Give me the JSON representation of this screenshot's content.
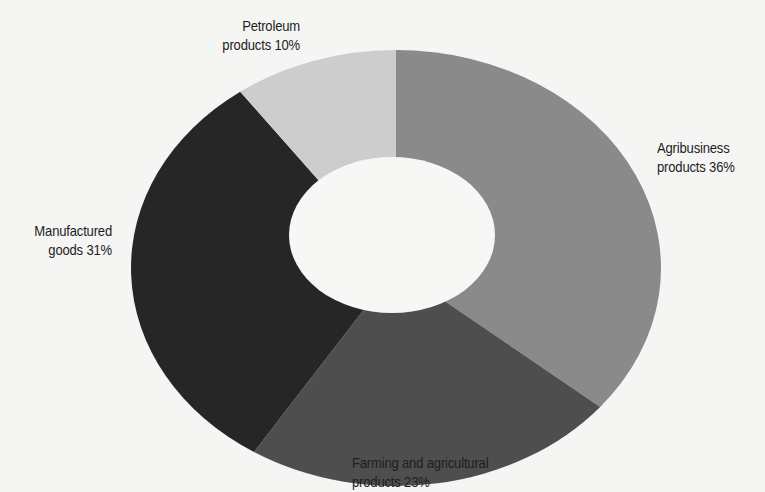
{
  "chart_data": {
    "type": "pie",
    "variant": "donut",
    "title": "",
    "start_angle_deg": 0,
    "direction": "clockwise",
    "categories": [
      "Agribusiness products",
      "Farming and agricultural products",
      "Manufactured goods",
      "Petroleum products"
    ],
    "values": [
      36,
      23,
      31,
      10
    ],
    "unit": "%",
    "colors": [
      "#8a8a8a",
      "#4e4e4e",
      "#262626",
      "#cdcdcd"
    ],
    "legend": "none",
    "data_labels": true
  },
  "labels": {
    "petroleum": {
      "line1": "Petroleum",
      "line2": "products 10%"
    },
    "agribusiness": {
      "line1": "Agribusiness",
      "line2": "products 36%"
    },
    "manufactured": {
      "line1": "Manufactured",
      "line2": "goods 31%"
    },
    "farming": {
      "line1": "Farming and agricultural",
      "line2": "products 23%"
    }
  },
  "geometry": {
    "cx": 396,
    "cy": 268,
    "rx": 265,
    "ry": 218,
    "hole_cx": 392,
    "hole_cy": 235,
    "hole_rx": 103,
    "hole_ry": 78
  },
  "background": "#f5f5f3",
  "hole_color": "#f7f7f5"
}
